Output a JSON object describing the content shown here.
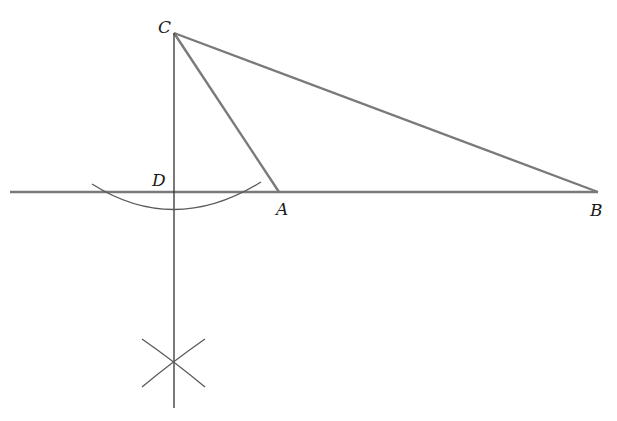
{
  "diagram": {
    "type": "geometric-construction",
    "colors": {
      "triangle_stroke": "#7a7a7a",
      "construction_stroke": "#5a5a5a",
      "label": "#1a1a1a",
      "background": "#ffffff"
    },
    "points": {
      "A": {
        "label": "A",
        "x": 279,
        "y": 192
      },
      "B": {
        "label": "B",
        "x": 598,
        "y": 192
      },
      "C": {
        "label": "C",
        "x": 174,
        "y": 33
      },
      "D": {
        "label": "D",
        "x": 174,
        "y": 192
      },
      "X": {
        "label": "",
        "x": 173,
        "y": 368
      }
    },
    "labels": {
      "A": "A",
      "B": "B",
      "C": "C",
      "D": "D"
    },
    "segments": [
      {
        "name": "CA",
        "from": "C",
        "to": "A"
      },
      {
        "name": "CB",
        "from": "C",
        "to": "B"
      },
      {
        "name": "baseline",
        "from": "line-start",
        "to": "B"
      }
    ]
  }
}
